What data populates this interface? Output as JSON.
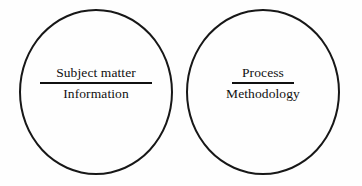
{
  "diagram": {
    "type": "two-circle-concept-diagram",
    "background_color": "#fefefe",
    "stroke_color": "#171717",
    "text_color": "#101010",
    "circles": [
      {
        "name": "left-circle",
        "numerator": "Subject matter",
        "denominator": "Information"
      },
      {
        "name": "right-circle",
        "numerator": "Process",
        "denominator": "Methodology"
      }
    ]
  }
}
